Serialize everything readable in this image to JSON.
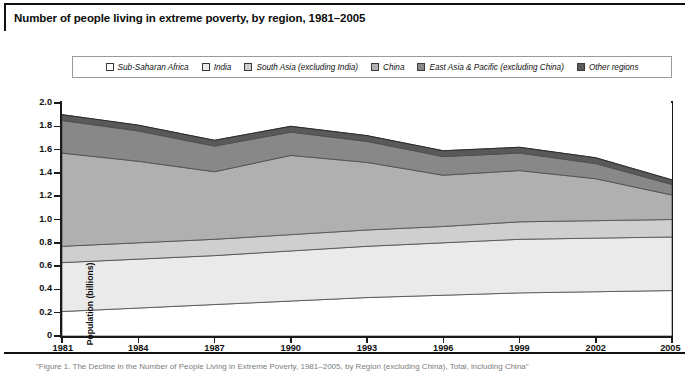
{
  "title": "Number of people living in extreme poverty, by region, 1981–2005",
  "source_note": "\"Figure 1. The Decline in the Number of People Living in Extreme Poverty, 1981–2005, by Region (excluding China), Total, including China\"",
  "axis": {
    "y_title": "Population (billions)",
    "y_ticks": [
      "2.0",
      "1.8",
      "1.6",
      "1.4",
      "1.2",
      "1.0",
      "0.8",
      "0.6",
      "0.4",
      "0.2",
      "0"
    ],
    "x_ticks": [
      "1981",
      "1984",
      "1987",
      "1990",
      "1993",
      "1996",
      "1999",
      "2002",
      "2005"
    ]
  },
  "legend": {
    "items": [
      {
        "label": "Sub-Saharan Africa",
        "color": "#ffffff"
      },
      {
        "label": "India",
        "color": "#eaeaea"
      },
      {
        "label": "South Asia (excluding India)",
        "color": "#cfcfcf"
      },
      {
        "label": "China",
        "color": "#b0b0b0"
      },
      {
        "label": "East Asia & Pacific (excluding China)",
        "color": "#888888"
      },
      {
        "label": "Other regions",
        "color": "#595959"
      }
    ]
  },
  "chart_data": {
    "type": "area",
    "stacked": true,
    "title": "Number of people living in extreme poverty, by region, 1981–2005",
    "xlabel": "",
    "ylabel": "Population (billions)",
    "ylim": [
      0,
      2.0
    ],
    "xlim": [
      1981,
      2005
    ],
    "y_tick_step": 0.2,
    "grid": false,
    "legend_position": "top",
    "x": [
      1981,
      1984,
      1987,
      1990,
      1993,
      1996,
      1999,
      2002,
      2005
    ],
    "series": [
      {
        "name": "Sub-Saharan Africa",
        "color": "#ffffff",
        "values": [
          0.21,
          0.24,
          0.27,
          0.3,
          0.33,
          0.35,
          0.37,
          0.38,
          0.39
        ]
      },
      {
        "name": "India",
        "color": "#eaeaea",
        "values": [
          0.42,
          0.42,
          0.42,
          0.43,
          0.44,
          0.45,
          0.46,
          0.46,
          0.46
        ]
      },
      {
        "name": "South Asia (excluding India)",
        "color": "#cfcfcf",
        "values": [
          0.14,
          0.14,
          0.14,
          0.14,
          0.14,
          0.14,
          0.15,
          0.15,
          0.15
        ]
      },
      {
        "name": "China",
        "color": "#b0b0b0",
        "values": [
          0.8,
          0.7,
          0.58,
          0.68,
          0.58,
          0.44,
          0.44,
          0.36,
          0.21
        ]
      },
      {
        "name": "East Asia & Pacific (excluding China)",
        "color": "#888888",
        "values": [
          0.28,
          0.26,
          0.22,
          0.2,
          0.18,
          0.16,
          0.15,
          0.13,
          0.09
        ]
      },
      {
        "name": "Other regions",
        "color": "#595959",
        "values": [
          0.05,
          0.05,
          0.05,
          0.05,
          0.05,
          0.05,
          0.05,
          0.05,
          0.04
        ]
      }
    ],
    "totals": [
      1.9,
      1.81,
      1.68,
      1.8,
      1.72,
      1.59,
      1.62,
      1.53,
      1.34
    ]
  }
}
